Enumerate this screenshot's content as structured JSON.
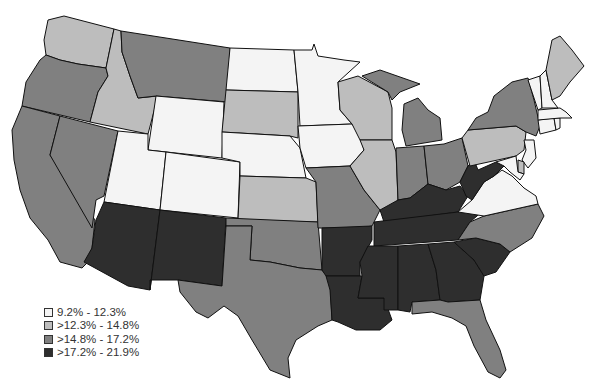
{
  "map": {
    "type": "choropleth",
    "region": "Contiguous United States",
    "colors": {
      "c1": "#f4f4f4",
      "c2": "#bdbdbd",
      "c3": "#808080",
      "c4": "#2e2e2e"
    },
    "legend": [
      {
        "label": "9.2% - 12.3%",
        "class": "c1"
      },
      {
        "label": ">12.3% - 14.8%",
        "class": "c2"
      },
      {
        "label": ">14.8% - 17.2%",
        "class": "c3"
      },
      {
        "label": ">17.2% - 21.9%",
        "class": "c4"
      }
    ],
    "states": {
      "WA": "c2",
      "OR": "c3",
      "CA": "c3",
      "NV": "c3",
      "ID": "c2",
      "MT": "c3",
      "WY": "c1",
      "UT": "c1",
      "CO": "c1",
      "AZ": "c4",
      "NM": "c4",
      "ND": "c1",
      "SD": "c2",
      "NE": "c1",
      "KS": "c2",
      "OK": "c3",
      "TX": "c3",
      "MN": "c1",
      "IA": "c1",
      "MO": "c3",
      "AR": "c4",
      "LA": "c4",
      "WI": "c2",
      "IL": "c2",
      "MI": "c3",
      "IN": "c3",
      "OH": "c3",
      "KY": "c4",
      "TN": "c4",
      "MS": "c4",
      "AL": "c4",
      "GA": "c4",
      "FL": "c3",
      "SC": "c4",
      "NC": "c3",
      "VA": "c1",
      "WV": "c4",
      "PA": "c2",
      "NY": "c3",
      "NJ": "c1",
      "DE": "c2",
      "MD": "c1",
      "CT": "c1",
      "RI": "c1",
      "MA": "c1",
      "VT": "c1",
      "NH": "c1",
      "ME": "c2"
    }
  }
}
